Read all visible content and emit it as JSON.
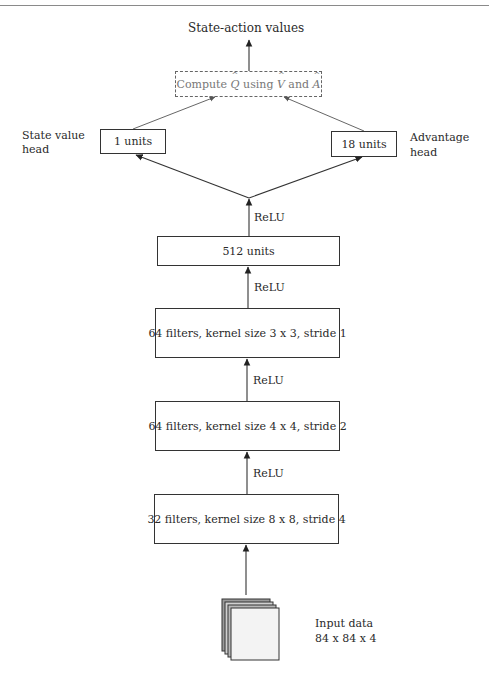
{
  "figure": {
    "title_output": "State-action values",
    "aggregation": {
      "prefix": "Compute ",
      "q_symbol": "Q",
      "middle": " using ",
      "v_symbol": "V",
      "and": " and ",
      "a_symbol": "A"
    },
    "heads": {
      "state_value": {
        "box_label": "1 units",
        "side_label_line1": "State value",
        "side_label_line2": "head"
      },
      "advantage": {
        "box_label": "18 units",
        "side_label_line1": "Advantage",
        "side_label_line2": "head"
      }
    },
    "layers": [
      {
        "id": "fc",
        "label": "512 units"
      },
      {
        "id": "conv3",
        "label": "64 filters, kernel size 3 x 3, stride 1"
      },
      {
        "id": "conv2",
        "label": "64 filters, kernel size 4 x 4, stride 2"
      },
      {
        "id": "conv1",
        "label": "32 filters, kernel size 8 x 8, stride 4"
      }
    ],
    "activations": [
      "ReLU",
      "ReLU",
      "ReLU",
      "ReLU"
    ],
    "input": {
      "line1": "Input data",
      "line2": "84 x 84 x 4"
    },
    "caption": ""
  },
  "colors": {
    "stroke": "#333333",
    "dashed_stroke": "#666666",
    "text": "#2a2a2a",
    "muted_text": "#777777"
  }
}
